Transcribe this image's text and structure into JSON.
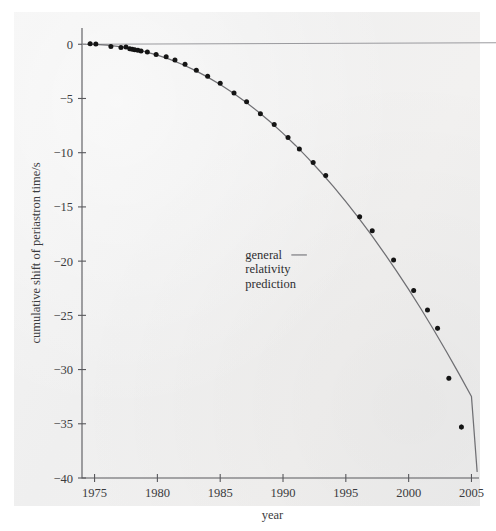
{
  "figure": {
    "background_color": "#f1f0ef",
    "page_color": "#ffffff"
  },
  "chart_data": {
    "type": "scatter",
    "title": "",
    "subtitle": "",
    "xlabel": "year",
    "ylabel": "cumulative shift of periastron time/s",
    "xlim": [
      1974,
      2005.6
    ],
    "ylim": [
      -40,
      1.5
    ],
    "xticks": [
      1975,
      1980,
      1985,
      1990,
      1995,
      2000,
      2005
    ],
    "xticklabels": [
      "1975",
      "1980",
      "1985",
      "1990",
      "1995",
      "2000",
      "2005"
    ],
    "yticks": [
      0,
      -5,
      -10,
      -15,
      -20,
      -25,
      -30,
      -35,
      -40
    ],
    "yticklabels": [
      "0",
      "-5",
      "-10",
      "-15",
      "-20",
      "-25",
      "-30",
      "-35",
      "-40"
    ],
    "grid": false,
    "legend": "none",
    "reference_lines": [
      {
        "name": "zero-line",
        "orientation": "horizontal",
        "y": 0,
        "color": "#9a9a9e"
      }
    ],
    "annotations": [
      {
        "name": "general-relativity-prediction",
        "lines": [
          "general",
          "relativity",
          "prediction"
        ],
        "text": "general relativity prediction",
        "x": 1987.0,
        "y": -19.8,
        "leader_to_x": 1991.9,
        "leader_to_y": -19.8
      }
    ],
    "series": [
      {
        "name": "general relativity prediction",
        "type": "line",
        "color": "#6f6f73",
        "x": [
          1974.4,
          1975,
          1976,
          1977,
          1978,
          1979,
          1980,
          1981,
          1982,
          1983,
          1984,
          1985,
          1986,
          1987,
          1988,
          1989,
          1990,
          1991,
          1992,
          1993,
          1994,
          1995,
          1996,
          1997,
          1998,
          1999,
          2000,
          2001,
          2002,
          2003,
          2004,
          2005
        ],
        "y": [
          0.0,
          -0.02,
          -0.09,
          -0.22,
          -0.41,
          -0.67,
          -1.0,
          -1.4,
          -1.87,
          -2.41,
          -3.03,
          -3.71,
          -4.47,
          -5.3,
          -6.2,
          -7.17,
          -8.22,
          -9.33,
          -10.52,
          -11.78,
          -13.11,
          -14.52,
          -15.99,
          -17.54,
          -19.16,
          -20.85,
          -22.61,
          -24.44,
          -26.35,
          -28.33,
          -30.37,
          -32.49
        ]
      },
      {
        "name": "measured cumulative periastron shift",
        "type": "scatter",
        "color": "#141414",
        "marker": "circle",
        "points": [
          {
            "x": 1974.65,
            "y": 0.05,
            "yerr": 0.35
          },
          {
            "x": 1975.1,
            "y": 0.02,
            "yerr": 0.3
          },
          {
            "x": 1976.3,
            "y": -0.2,
            "yerr": 0.25
          },
          {
            "x": 1977.1,
            "y": -0.3,
            "yerr": 0.22
          },
          {
            "x": 1977.5,
            "y": -0.25,
            "yerr": 0.22
          },
          {
            "x": 1977.8,
            "y": -0.42,
            "yerr": 0.2
          },
          {
            "x": 1978.0,
            "y": -0.45,
            "yerr": 0.2
          },
          {
            "x": 1978.2,
            "y": -0.5,
            "yerr": 0.2
          },
          {
            "x": 1978.45,
            "y": -0.55,
            "yerr": 0.2
          },
          {
            "x": 1978.7,
            "y": -0.62,
            "yerr": 0.18
          },
          {
            "x": 1979.2,
            "y": -0.72,
            "yerr": 0.18
          },
          {
            "x": 1979.9,
            "y": -0.95,
            "yerr": 0.18
          },
          {
            "x": 1980.7,
            "y": -1.15,
            "yerr": 0.18
          },
          {
            "x": 1981.4,
            "y": -1.45,
            "yerr": 0.18
          },
          {
            "x": 1982.2,
            "y": -1.85,
            "yerr": 0.18
          },
          {
            "x": 1983.1,
            "y": -2.4,
            "yerr": 0.18
          },
          {
            "x": 1984.0,
            "y": -2.95,
            "yerr": 0.18
          },
          {
            "x": 1985.0,
            "y": -3.6,
            "yerr": 0.18
          },
          {
            "x": 1986.1,
            "y": -4.5,
            "yerr": 0.18
          },
          {
            "x": 1987.1,
            "y": -5.3,
            "yerr": 0.2
          },
          {
            "x": 1988.2,
            "y": -6.4,
            "yerr": 0.2
          },
          {
            "x": 1989.3,
            "y": -7.4,
            "yerr": 0.2
          },
          {
            "x": 1990.4,
            "y": -8.6,
            "yerr": 0.2
          },
          {
            "x": 1991.3,
            "y": -9.65,
            "yerr": 0.2
          },
          {
            "x": 1992.4,
            "y": -10.9,
            "yerr": 0.25
          },
          {
            "x": 1993.4,
            "y": -12.1,
            "yerr": 0.25
          },
          {
            "x": 1996.1,
            "y": -15.9,
            "yerr": 0.3
          },
          {
            "x": 1997.1,
            "y": -17.2,
            "yerr": 0.3
          },
          {
            "x": 1998.8,
            "y": -19.9,
            "yerr": 0.3
          },
          {
            "x": 2000.4,
            "y": -22.7,
            "yerr": 0.35
          },
          {
            "x": 2001.5,
            "y": -24.5,
            "yerr": 0.35
          },
          {
            "x": 2002.3,
            "y": -26.2,
            "yerr": 0.4
          },
          {
            "x": 2003.2,
            "y": -30.8,
            "yerr": 0.4
          },
          {
            "x": 2004.2,
            "y": -35.3,
            "yerr": 0.45
          }
        ]
      }
    ]
  }
}
